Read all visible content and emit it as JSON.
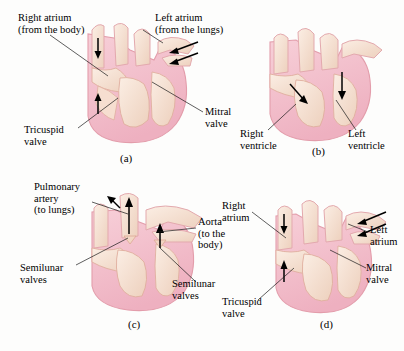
{
  "figure": {
    "background_color": "#fdfdfc",
    "heart_colors": {
      "outer_pink": "#f4c3cd",
      "muscle_pink": "#f0b9c6",
      "chamber_cream": "#f7e2d4",
      "vessel_cream": "#f8e6da",
      "outline": "#e59aa9",
      "shadow": "#e9d3c6"
    }
  },
  "panels": [
    {
      "id": "a",
      "caption": "(a)",
      "labels": [
        {
          "key": "right_atrium",
          "text": "Right atrium\n(from the body)"
        },
        {
          "key": "left_atrium",
          "text": "Left atrium\n(from the lungs)"
        },
        {
          "key": "mitral_valve",
          "text": "Mitral\nvalve"
        },
        {
          "key": "tricuspid_valve",
          "text": "Tricuspid\nvalve"
        }
      ],
      "flow_arrows": [
        {
          "key": "right-atrium-inflow-down",
          "direction": "down"
        },
        {
          "key": "right-atrium-inflow-up",
          "direction": "up"
        },
        {
          "key": "left-atrium-inflow-1",
          "direction": "down-left"
        },
        {
          "key": "left-atrium-inflow-2",
          "direction": "down-left"
        }
      ]
    },
    {
      "id": "b",
      "caption": "(b)",
      "labels": [
        {
          "key": "right_ventricle",
          "text": "Right\nventricle"
        },
        {
          "key": "left_ventricle",
          "text": "Left\nventricle"
        }
      ],
      "flow_arrows": [
        {
          "key": "right-ventricle-filling",
          "direction": "down-right"
        },
        {
          "key": "left-ventricle-filling",
          "direction": "down"
        }
      ]
    },
    {
      "id": "c",
      "caption": "(c)",
      "labels": [
        {
          "key": "pulmonary_artery",
          "text": "Pulmonary\nartery\n(to lungs)"
        },
        {
          "key": "aorta",
          "text": "Aorta\n(to the\nbody)"
        },
        {
          "key": "semilunar_valves_left",
          "text": "Semilunar\nvalves"
        },
        {
          "key": "semilunar_valves_right",
          "text": "Semilunar\nvalves"
        }
      ],
      "flow_arrows": [
        {
          "key": "pulmonary-outflow-left",
          "direction": "up-left"
        },
        {
          "key": "pulmonary-outflow-up",
          "direction": "up"
        },
        {
          "key": "aortic-outflow",
          "direction": "up"
        }
      ]
    },
    {
      "id": "d",
      "caption": "(d)",
      "labels": [
        {
          "key": "right_atrium",
          "text": "Right\natrium"
        },
        {
          "key": "left_atrium",
          "text": "Left\natrium"
        },
        {
          "key": "mitral_valve",
          "text": "Mitral\nvalve"
        },
        {
          "key": "tricuspid_valve",
          "text": "Tricuspid\nvalve"
        }
      ],
      "flow_arrows": [
        {
          "key": "right-atrium-inflow-down",
          "direction": "down"
        },
        {
          "key": "right-atrium-inflow-up",
          "direction": "up"
        },
        {
          "key": "left-atrium-inflow-1",
          "direction": "down-left"
        },
        {
          "key": "left-atrium-inflow-2",
          "direction": "down-left"
        }
      ]
    }
  ]
}
